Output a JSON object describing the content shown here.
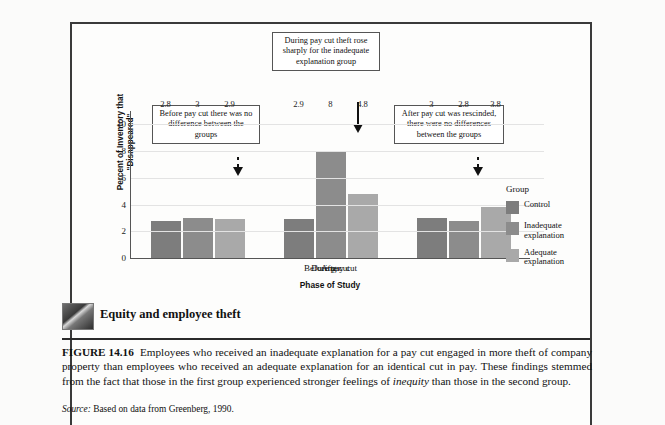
{
  "figure": {
    "number_label": "FIGURE 14.16",
    "thumb_caption": "Equity and employee theft",
    "caption_text": "Employees who received an inadequate explanation for a pay cut engaged in more theft of company property than employees who received an adequate explanation for an identical cut in pay. These findings stemmed from the fact that those in the first group experienced stronger feelings of ",
    "caption_italic": "inequity",
    "caption_tail": " than those in the second group.",
    "source_label": "Source:",
    "source_text": "Based on data from Greenberg, 1990."
  },
  "annotations": {
    "before": "Before pay cut there was no difference between the groups",
    "during": "During pay cut theft rose sharply for the inadequate explanation group",
    "after": "After pay cut was rescinded, there were no differences between the groups"
  },
  "legend": {
    "title": "Group",
    "items": [
      {
        "label": "Control",
        "color": "#7d7d7d"
      },
      {
        "label": "Inadequate explanation",
        "color": "#8c8c8c"
      },
      {
        "label": "Adequate explanation",
        "color": "#a9a9a9"
      }
    ]
  },
  "chart_data": {
    "type": "bar",
    "title": "",
    "xlabel": "Phase of Study",
    "ylabel": "Percent of Inventory that \"Disappeared\"",
    "categories": [
      "Before pay cut",
      "During cut",
      "After"
    ],
    "series": [
      {
        "name": "Control",
        "color": "#7d7d7d",
        "values": [
          2.8,
          2.9,
          3
        ]
      },
      {
        "name": "Inadequate explanation",
        "color": "#8c8c8c",
        "values": [
          3,
          8,
          2.8
        ]
      },
      {
        "name": "Adequate explanation",
        "color": "#a9a9a9",
        "values": [
          2.9,
          4.8,
          3.8
        ]
      }
    ],
    "value_labels": [
      [
        "2.8",
        "3",
        "2.9"
      ],
      [
        "2.9",
        "8",
        "4.8"
      ],
      [
        "3",
        "2.8",
        "3.8"
      ]
    ],
    "ylim": [
      0,
      11
    ],
    "yticks": [
      0,
      2,
      4,
      6,
      8,
      10
    ],
    "ytick_labels": [
      "0",
      "2",
      "4",
      "6",
      "8",
      "10"
    ],
    "grid": true,
    "legend_position": "right"
  }
}
